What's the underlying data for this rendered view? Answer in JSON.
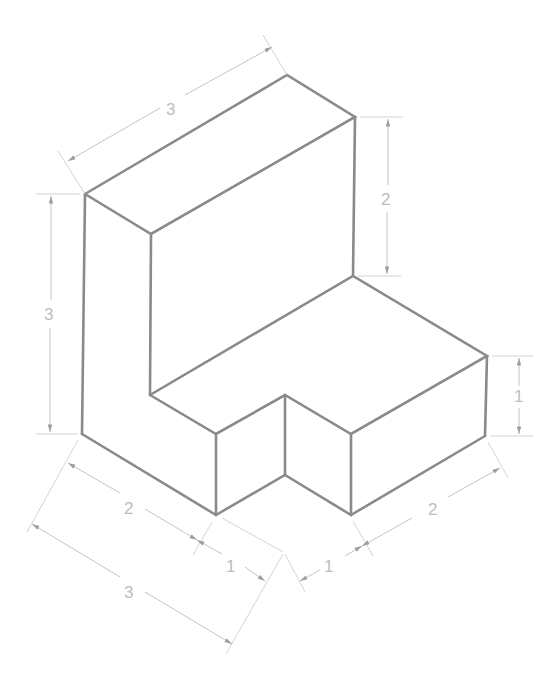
{
  "figure": {
    "type": "isometric-drawing",
    "line_color": "#8a8a8a",
    "dimension_color": "#bdbdbd"
  },
  "dimensions": {
    "top_depth": "3",
    "left_height": "3",
    "back_upper_height": "2",
    "right_step_height": "1",
    "bottom_left_outer": "3",
    "bottom_left_inner": "2",
    "bottom_notch_left": "1",
    "bottom_notch_right": "1",
    "bottom_right": "2"
  }
}
